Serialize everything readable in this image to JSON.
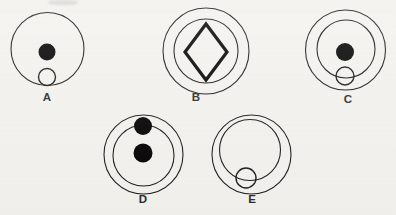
{
  "sheet": {
    "title": "Figure Comparison Set",
    "background_color": "#f2f1ed",
    "stroke_color": "#1a1a1a",
    "fill_color": "#000000",
    "width": 396,
    "height": 215
  },
  "figures": [
    {
      "id": "A",
      "label": "A",
      "label_x": 47,
      "label_y": 101,
      "shapes": [
        {
          "kind": "circle-outline",
          "name": "outer-circle",
          "cx": 47.5,
          "cy": 49,
          "r": 36.5,
          "stroke_width": 1.1
        },
        {
          "kind": "circle-filled",
          "name": "black-dot",
          "cx": 47,
          "cy": 52,
          "r": 8.5
        },
        {
          "kind": "circle-outline",
          "name": "small-hollow-circle",
          "cx": 47,
          "cy": 77,
          "r": 8.5,
          "stroke_width": 1.4
        }
      ]
    },
    {
      "id": "B",
      "label": "B",
      "label_x": 196,
      "label_y": 101,
      "shapes": [
        {
          "kind": "circle-outline",
          "name": "outer-circle",
          "cx": 206,
          "cy": 51,
          "r": 43,
          "stroke_width": 1.1
        },
        {
          "kind": "circle-outline",
          "name": "inner-circle",
          "cx": 206,
          "cy": 51,
          "r": 32,
          "stroke_width": 1.1
        },
        {
          "kind": "diamond-outline",
          "name": "diamond",
          "cx": 206,
          "cy": 52,
          "rx": 21,
          "ry": 28,
          "stroke_width": 3.2
        }
      ]
    },
    {
      "id": "C",
      "label": "C",
      "label_x": 348,
      "label_y": 103,
      "shapes": [
        {
          "kind": "circle-outline",
          "name": "outer-circle",
          "cx": 345.5,
          "cy": 50,
          "r": 40,
          "stroke_width": 1.1
        },
        {
          "kind": "circle-outline",
          "name": "inner-circle",
          "cx": 346,
          "cy": 49,
          "r": 29,
          "stroke_width": 1.1
        },
        {
          "kind": "circle-filled",
          "name": "black-dot",
          "cx": 345,
          "cy": 52,
          "r": 9
        },
        {
          "kind": "circle-outline",
          "name": "small-hollow-circle",
          "cx": 345,
          "cy": 76,
          "r": 9,
          "stroke_width": 1.4
        }
      ]
    },
    {
      "id": "D",
      "label": "D",
      "label_x": 143,
      "label_y": 203,
      "shapes": [
        {
          "kind": "circle-outline",
          "name": "outer-circle",
          "cx": 143.5,
          "cy": 154.5,
          "r": 39.5,
          "stroke_width": 1.1
        },
        {
          "kind": "circle-outline",
          "name": "inner-circle",
          "cx": 143.5,
          "cy": 155.5,
          "r": 30.5,
          "stroke_width": 1.1
        },
        {
          "kind": "circle-filled",
          "name": "black-dot-top",
          "cx": 143,
          "cy": 126,
          "r": 9
        },
        {
          "kind": "circle-filled",
          "name": "black-dot-bottom",
          "cx": 143,
          "cy": 153,
          "r": 9.5
        }
      ]
    },
    {
      "id": "E",
      "label": "E",
      "label_x": 252,
      "label_y": 203,
      "shapes": [
        {
          "kind": "circle-outline",
          "name": "outer-circle",
          "cx": 251.5,
          "cy": 154.5,
          "r": 39.5,
          "stroke_width": 1.1
        },
        {
          "kind": "circle-outline",
          "name": "inner-circle",
          "cx": 250,
          "cy": 150,
          "r": 30.5,
          "stroke_width": 1.1
        },
        {
          "kind": "circle-outline",
          "name": "small-hollow-circle",
          "cx": 246,
          "cy": 178,
          "r": 10,
          "stroke_width": 1.4
        }
      ]
    }
  ]
}
